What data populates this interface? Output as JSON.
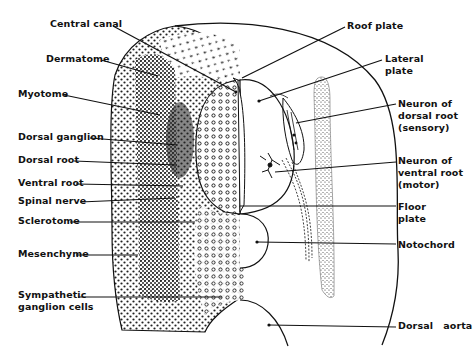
{
  "figure": {
    "labels_left": [
      {
        "id": "central-canal",
        "text": "Central canal",
        "x": 50,
        "y": 18
      },
      {
        "id": "dermatome",
        "text": "Dermatome",
        "x": 46,
        "y": 53
      },
      {
        "id": "myotome",
        "text": "Myotome",
        "x": 18,
        "y": 88
      },
      {
        "id": "dorsal-ganglion",
        "text": "Dorsal ganglion",
        "x": 18,
        "y": 131
      },
      {
        "id": "dorsal-root",
        "text": "Dorsal root",
        "x": 18,
        "y": 154
      },
      {
        "id": "ventral-root",
        "text": "Ventral root",
        "x": 18,
        "y": 177
      },
      {
        "id": "spinal-nerve",
        "text": "Spinal nerve",
        "x": 18,
        "y": 195
      },
      {
        "id": "sclerotome",
        "text": "Sclerotome",
        "x": 18,
        "y": 215
      },
      {
        "id": "mesenchyme",
        "text": "Mesenchyme",
        "x": 18,
        "y": 248
      },
      {
        "id": "sympathetic-ganglion-cells",
        "text": "Sympathetic\nganglion cells",
        "x": 18,
        "y": 289
      }
    ],
    "labels_right": [
      {
        "id": "roof-plate",
        "text": "Roof plate",
        "x": 347,
        "y": 20
      },
      {
        "id": "lateral-plate",
        "text": "Lateral\nplate",
        "x": 385,
        "y": 53
      },
      {
        "id": "neuron-dorsal-root",
        "text": "Neuron of\ndorsal root\n(sensory)",
        "x": 398,
        "y": 98
      },
      {
        "id": "neuron-ventral-root",
        "text": "Neuron of\nventral root\n(motor)",
        "x": 398,
        "y": 155
      },
      {
        "id": "floor-plate",
        "text": "Floor\nplate",
        "x": 398,
        "y": 201
      },
      {
        "id": "notochord",
        "text": "Notochord",
        "x": 398,
        "y": 239
      },
      {
        "id": "dorsal-aorta",
        "text": "Dorsal   aorta",
        "x": 398,
        "y": 320
      }
    ]
  }
}
